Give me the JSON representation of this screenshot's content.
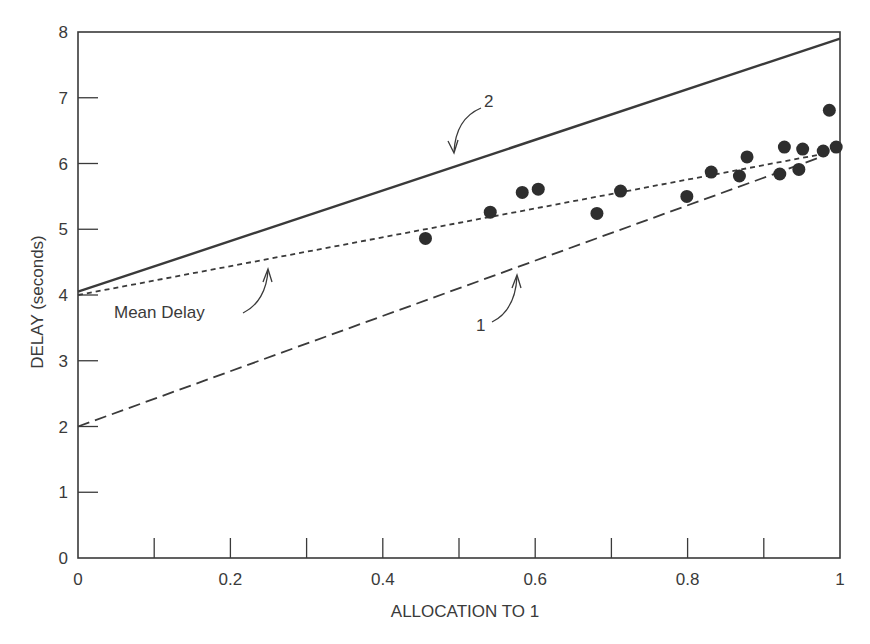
{
  "chart_data": {
    "type": "line",
    "title": "",
    "xlabel": "ALLOCATION TO 1",
    "ylabel": "DELAY (seconds)",
    "xlim": [
      0,
      1
    ],
    "ylim": [
      0,
      8
    ],
    "grid": false,
    "legend": null,
    "x_ticks": [
      0,
      0.1,
      0.2,
      0.3,
      0.4,
      0.5,
      0.6,
      0.7,
      0.8,
      0.9,
      1
    ],
    "x_tick_labels": [
      "0",
      "",
      "0.2",
      "",
      "0.4",
      "",
      "0.6",
      "",
      "0.8",
      "",
      "1"
    ],
    "y_ticks": [
      0,
      1,
      2,
      3,
      4,
      5,
      6,
      7,
      8
    ],
    "y_tick_labels": [
      "0",
      "1",
      "2",
      "3",
      "4",
      "5",
      "6",
      "7",
      "8"
    ],
    "series": [
      {
        "name": "2",
        "style": "solid",
        "x": [
          0,
          1
        ],
        "y": [
          4.05,
          7.9
        ]
      },
      {
        "name": "Mean Delay",
        "style": "dotted",
        "x": [
          0,
          0.98
        ],
        "y": [
          4.0,
          6.15
        ]
      },
      {
        "name": "1",
        "style": "dashed",
        "x": [
          0,
          0.98
        ],
        "y": [
          2.0,
          6.12
        ]
      },
      {
        "name": "observed",
        "style": "scatter",
        "x": [
          0.456,
          0.541,
          0.583,
          0.604,
          0.681,
          0.712,
          0.799,
          0.831,
          0.868,
          0.878,
          0.921,
          0.927,
          0.946,
          0.951,
          0.978,
          0.986,
          0.995
        ],
        "y": [
          4.86,
          5.26,
          5.56,
          5.61,
          5.24,
          5.58,
          5.5,
          5.87,
          5.81,
          6.1,
          5.84,
          6.25,
          5.91,
          6.22,
          6.19,
          6.81,
          6.25
        ]
      }
    ],
    "annotations": [
      {
        "text": "2",
        "target_series": "2",
        "target_x": 0.49,
        "target_y": 6.2
      },
      {
        "text": "Mean Delay",
        "target_series": "Mean Delay",
        "target_x": 0.25,
        "target_y": 4.55
      },
      {
        "text": "1",
        "target_series": "1",
        "target_x": 0.57,
        "target_y": 4.4
      }
    ]
  },
  "labels": {
    "xlabel": "ALLOCATION TO 1",
    "ylabel": "DELAY (seconds)",
    "anno_2": "2",
    "anno_mean": "Mean Delay",
    "anno_1": "1"
  }
}
